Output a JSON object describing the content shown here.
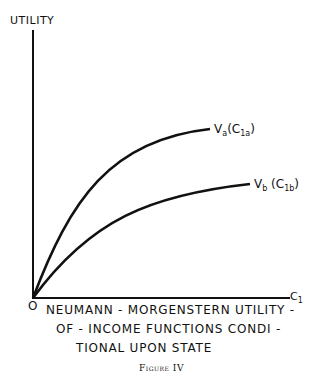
{
  "figure": {
    "y_axis_label": "UTILITY",
    "x_axis_label": "C₁",
    "origin_label": "O",
    "curves": [
      {
        "id": "a",
        "label": "Vₐ (C₁ₐ)",
        "label_text": "Va(C1a)"
      },
      {
        "id": "b",
        "label": "V_b (C₁b)",
        "label_text": "Vb (C1b)"
      }
    ],
    "caption_lines": [
      "NEUMANN - MORGENSTERN UTILITY -",
      "OF - INCOME FUNCTIONS CONDI -",
      "TIONAL UPON STATE"
    ],
    "figure_title": "Figure IV"
  },
  "colors": {
    "ink": "#111111",
    "background": "#ffffff"
  }
}
